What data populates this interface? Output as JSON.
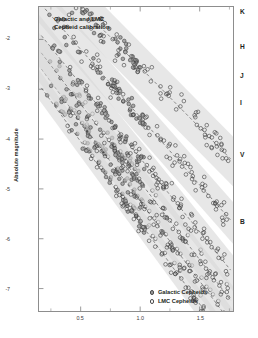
{
  "chart_data": {
    "type": "scatter",
    "title": "Galactic and LMC\nCepheid calibration",
    "title_line1": "Galactic and LMC",
    "title_line2": "Cepheid calibration",
    "xlabel": "",
    "ylabel": "Absolute magnitude",
    "xlim": [
      0.15,
      1.78
    ],
    "ylim": [
      -1.35,
      -7.45
    ],
    "y_inverted": true,
    "grid": false,
    "legend_position": "bottom-right",
    "xticks": [
      0.5,
      1.0,
      1.5
    ],
    "xtick_labels": [
      "0.5",
      "1.0",
      "1.5"
    ],
    "xticks_minor": [
      0.25,
      0.75,
      1.25,
      1.75
    ],
    "yticks": [
      -2,
      -3,
      -4,
      -5,
      -6,
      -7
    ],
    "ytick_labels": [
      "-2",
      "-3",
      "-4",
      "-5",
      "-6",
      "-7"
    ],
    "legend": [
      {
        "name": "Galactic Cepheids",
        "marker": "filled-circle",
        "color": "#9a9a9a",
        "edge": "#4a4a4a"
      },
      {
        "name": "LMC Cepheids",
        "marker": "open-circle",
        "color": "#ffffff",
        "edge": "#4a4a4a"
      }
    ],
    "band_color": "#d9d9d9",
    "fit_line_color": "#555555",
    "series": [
      {
        "name": "K",
        "label": "K",
        "label_y_frac": 0.018,
        "offset": -4.05,
        "slope": -3.26,
        "scatter_halfwidth": 0.3,
        "galactic_points": [
          [
            0.24,
            -2.83
          ],
          [
            0.27,
            -2.9
          ],
          [
            0.29,
            -3.0
          ],
          [
            0.31,
            -3.04
          ],
          [
            0.33,
            -3.14
          ],
          [
            0.35,
            -3.16
          ],
          [
            0.37,
            -3.26
          ],
          [
            0.4,
            -3.34
          ],
          [
            0.42,
            -3.44
          ],
          [
            0.45,
            -3.52
          ],
          [
            0.47,
            -3.58
          ],
          [
            0.5,
            -3.66
          ],
          [
            0.52,
            -3.74
          ],
          [
            0.55,
            -3.84
          ],
          [
            0.57,
            -3.88
          ],
          [
            0.6,
            -3.98
          ],
          [
            0.62,
            -4.08
          ],
          [
            0.65,
            -4.14
          ],
          [
            0.68,
            -4.24
          ],
          [
            0.7,
            -4.28
          ],
          [
            0.73,
            -4.4
          ],
          [
            0.76,
            -4.48
          ],
          [
            0.79,
            -4.56
          ],
          [
            0.82,
            -4.66
          ],
          [
            0.85,
            -4.74
          ],
          [
            0.88,
            -4.82
          ],
          [
            0.91,
            -4.92
          ],
          [
            0.94,
            -5.0
          ],
          [
            0.97,
            -5.08
          ],
          [
            1.0,
            -5.18
          ]
        ],
        "lmc_points": [
          [
            0.42,
            -3.4
          ],
          [
            0.48,
            -3.62
          ],
          [
            0.55,
            -3.8
          ],
          [
            0.62,
            -4.02
          ],
          [
            0.68,
            -4.2
          ],
          [
            0.72,
            -4.36
          ],
          [
            0.78,
            -4.52
          ],
          [
            0.83,
            -4.68
          ],
          [
            0.88,
            -4.84
          ],
          [
            0.92,
            -4.96
          ],
          [
            0.96,
            -5.1
          ],
          [
            1.0,
            -5.22
          ],
          [
            1.04,
            -5.36
          ],
          [
            1.08,
            -5.46
          ],
          [
            1.12,
            -5.58
          ],
          [
            1.16,
            -5.72
          ],
          [
            1.2,
            -5.82
          ],
          [
            1.24,
            -5.96
          ],
          [
            1.28,
            -6.08
          ],
          [
            1.32,
            -6.2
          ],
          [
            1.36,
            -6.32
          ],
          [
            1.4,
            -6.44
          ],
          [
            1.44,
            -6.56
          ],
          [
            1.48,
            -6.66
          ],
          [
            1.52,
            -6.78
          ],
          [
            1.56,
            -6.88
          ],
          [
            1.6,
            -7.0
          ],
          [
            1.64,
            -7.12
          ],
          [
            1.68,
            -7.22
          ],
          [
            1.72,
            -7.32
          ]
        ]
      },
      {
        "name": "H",
        "label": "H",
        "label_y_frac": 0.134,
        "offset": -3.65,
        "slope": -3.2,
        "scatter_halfwidth": 0.32,
        "galactic_points": [],
        "lmc_points": []
      },
      {
        "name": "J",
        "label": "J",
        "label_y_frac": 0.228,
        "offset": -3.3,
        "slope": -3.12,
        "scatter_halfwidth": 0.34,
        "galactic_points": [],
        "lmc_points": []
      },
      {
        "name": "I",
        "label": "I",
        "label_y_frac": 0.317,
        "offset": -2.9,
        "slope": -2.96,
        "scatter_halfwidth": 0.36,
        "galactic_points": [],
        "lmc_points": []
      },
      {
        "name": "V",
        "label": "V",
        "label_y_frac": 0.486,
        "offset": -2.2,
        "slope": -2.72,
        "scatter_halfwidth": 0.42,
        "galactic_points": [],
        "lmc_points": []
      },
      {
        "name": "B",
        "label": "B",
        "label_y_frac": 0.705,
        "offset": -1.35,
        "slope": -2.42,
        "scatter_halfwidth": 0.5,
        "galactic_points": [],
        "lmc_points": []
      }
    ]
  }
}
